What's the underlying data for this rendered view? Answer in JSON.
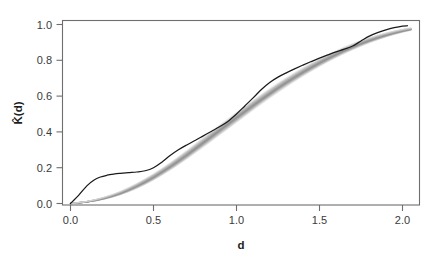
{
  "figure": {
    "kind": "statistical-plot",
    "background_color": "#ffffff"
  },
  "axes": {
    "x_title": "d",
    "y_title": "K̂(d)",
    "x_ticks": [
      "0.0",
      "0.5",
      "1.0",
      "1.5",
      "2.0"
    ],
    "y_ticks": [
      "0.0",
      "0.2",
      "0.4",
      "0.6",
      "0.8",
      "1.0"
    ],
    "frame_color": "#6e6e6e",
    "tick_label_color": "#3a3a3a"
  },
  "chart_data": {
    "type": "line",
    "title": "",
    "subtitle": "",
    "xlabel": "d",
    "ylabel": "K̂(d)",
    "xlim": [
      0.0,
      2.1
    ],
    "ylim": [
      0.0,
      1.02
    ],
    "grid": false,
    "legend": null,
    "x_ticks": [
      0.0,
      0.5,
      1.0,
      1.5,
      2.0
    ],
    "y_ticks": [
      0.0,
      0.2,
      0.4,
      0.6,
      0.8,
      1.0
    ],
    "series": [
      {
        "name": "observed K̂(d)",
        "color": "#1a1a1a",
        "linewidth": 1.25,
        "x": [
          0.0,
          0.05,
          0.1,
          0.14,
          0.18,
          0.22,
          0.26,
          0.3,
          0.35,
          0.4,
          0.45,
          0.5,
          0.55,
          0.6,
          0.65,
          0.7,
          0.75,
          0.8,
          0.85,
          0.9,
          0.95,
          1.0,
          1.05,
          1.1,
          1.15,
          1.2,
          1.25,
          1.3,
          1.35,
          1.4,
          1.45,
          1.5,
          1.55,
          1.6,
          1.65,
          1.7,
          1.75,
          1.8,
          1.85,
          1.9,
          1.95,
          2.0,
          2.03
        ],
        "y": [
          0.0,
          0.047,
          0.1,
          0.13,
          0.148,
          0.158,
          0.164,
          0.168,
          0.172,
          0.176,
          0.183,
          0.2,
          0.231,
          0.268,
          0.3,
          0.327,
          0.352,
          0.378,
          0.404,
          0.43,
          0.46,
          0.5,
          0.545,
          0.59,
          0.637,
          0.676,
          0.706,
          0.73,
          0.752,
          0.773,
          0.793,
          0.812,
          0.83,
          0.847,
          0.862,
          0.88,
          0.908,
          0.935,
          0.955,
          0.97,
          0.982,
          0.991,
          0.993
        ]
      },
      {
        "name": "simulation envelope (upper)",
        "color": "#9a9a9a",
        "x": [
          0.0,
          0.1,
          0.2,
          0.3,
          0.4,
          0.5,
          0.6,
          0.7,
          0.8,
          0.9,
          1.0,
          1.1,
          1.2,
          1.3,
          1.4,
          1.5,
          1.6,
          1.7,
          1.8,
          1.9,
          2.0,
          2.05
        ],
        "y": [
          0.0,
          0.012,
          0.034,
          0.066,
          0.11,
          0.163,
          0.224,
          0.292,
          0.363,
          0.434,
          0.504,
          0.572,
          0.637,
          0.698,
          0.754,
          0.804,
          0.85,
          0.89,
          0.924,
          0.951,
          0.972,
          0.98
        ]
      },
      {
        "name": "simulation envelope (lower)",
        "color": "#cfcfcf",
        "x": [
          0.0,
          0.1,
          0.2,
          0.3,
          0.4,
          0.5,
          0.6,
          0.7,
          0.8,
          0.9,
          1.0,
          1.1,
          1.2,
          1.3,
          1.4,
          1.5,
          1.6,
          1.7,
          1.8,
          1.9,
          2.0,
          2.05
        ],
        "y": [
          0.0,
          0.008,
          0.024,
          0.05,
          0.087,
          0.134,
          0.19,
          0.253,
          0.32,
          0.389,
          0.458,
          0.527,
          0.594,
          0.657,
          0.716,
          0.77,
          0.819,
          0.862,
          0.9,
          0.932,
          0.958,
          0.968
        ]
      }
    ],
    "envelope": {
      "description": "bundle of simulated K-function curves shaded light grey",
      "n_curves": 19,
      "color_light": "#e2e2e2",
      "color_dark": "#8f8f8f"
    }
  }
}
